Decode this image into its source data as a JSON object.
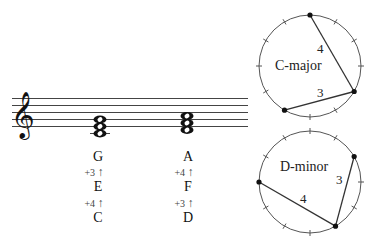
{
  "staff": {
    "clef": "treble",
    "lines_y": [
      98.5,
      105.5,
      112.5,
      119.5,
      126.5
    ],
    "x_start": 12,
    "x_end": 248,
    "chords": [
      {
        "name": "C-major",
        "x": 100,
        "notes": [
          "C",
          "E",
          "G"
        ]
      },
      {
        "name": "D-minor",
        "x": 187,
        "notes": [
          "D",
          "F",
          "A"
        ]
      }
    ]
  },
  "labels": {
    "col1": {
      "top": "G",
      "int_upper": "+3",
      "mid": "E",
      "int_lower": "+4",
      "bottom": "C"
    },
    "col2": {
      "top": "A",
      "int_upper": "+4",
      "mid": "F",
      "int_lower": "+3",
      "bottom": "D"
    },
    "arrow": "↑"
  },
  "circles": [
    {
      "title": "C-major",
      "cx": 310,
      "cy": 66,
      "r": 51,
      "positions": [
        0,
        4,
        7
      ],
      "edges": [
        {
          "from": 0,
          "to": 4,
          "label": "4"
        },
        {
          "from": 4,
          "to": 7,
          "label": "3"
        }
      ]
    },
    {
      "title": "D-minor",
      "cx": 310,
      "cy": 182,
      "r": 51,
      "positions": [
        2,
        5,
        9
      ],
      "edges": [
        {
          "from": 2,
          "to": 5,
          "label": "3"
        },
        {
          "from": 5,
          "to": 9,
          "label": "4"
        }
      ]
    }
  ],
  "colors": {
    "ink": "#111111",
    "circle": "#555555",
    "staff": "#444444"
  }
}
